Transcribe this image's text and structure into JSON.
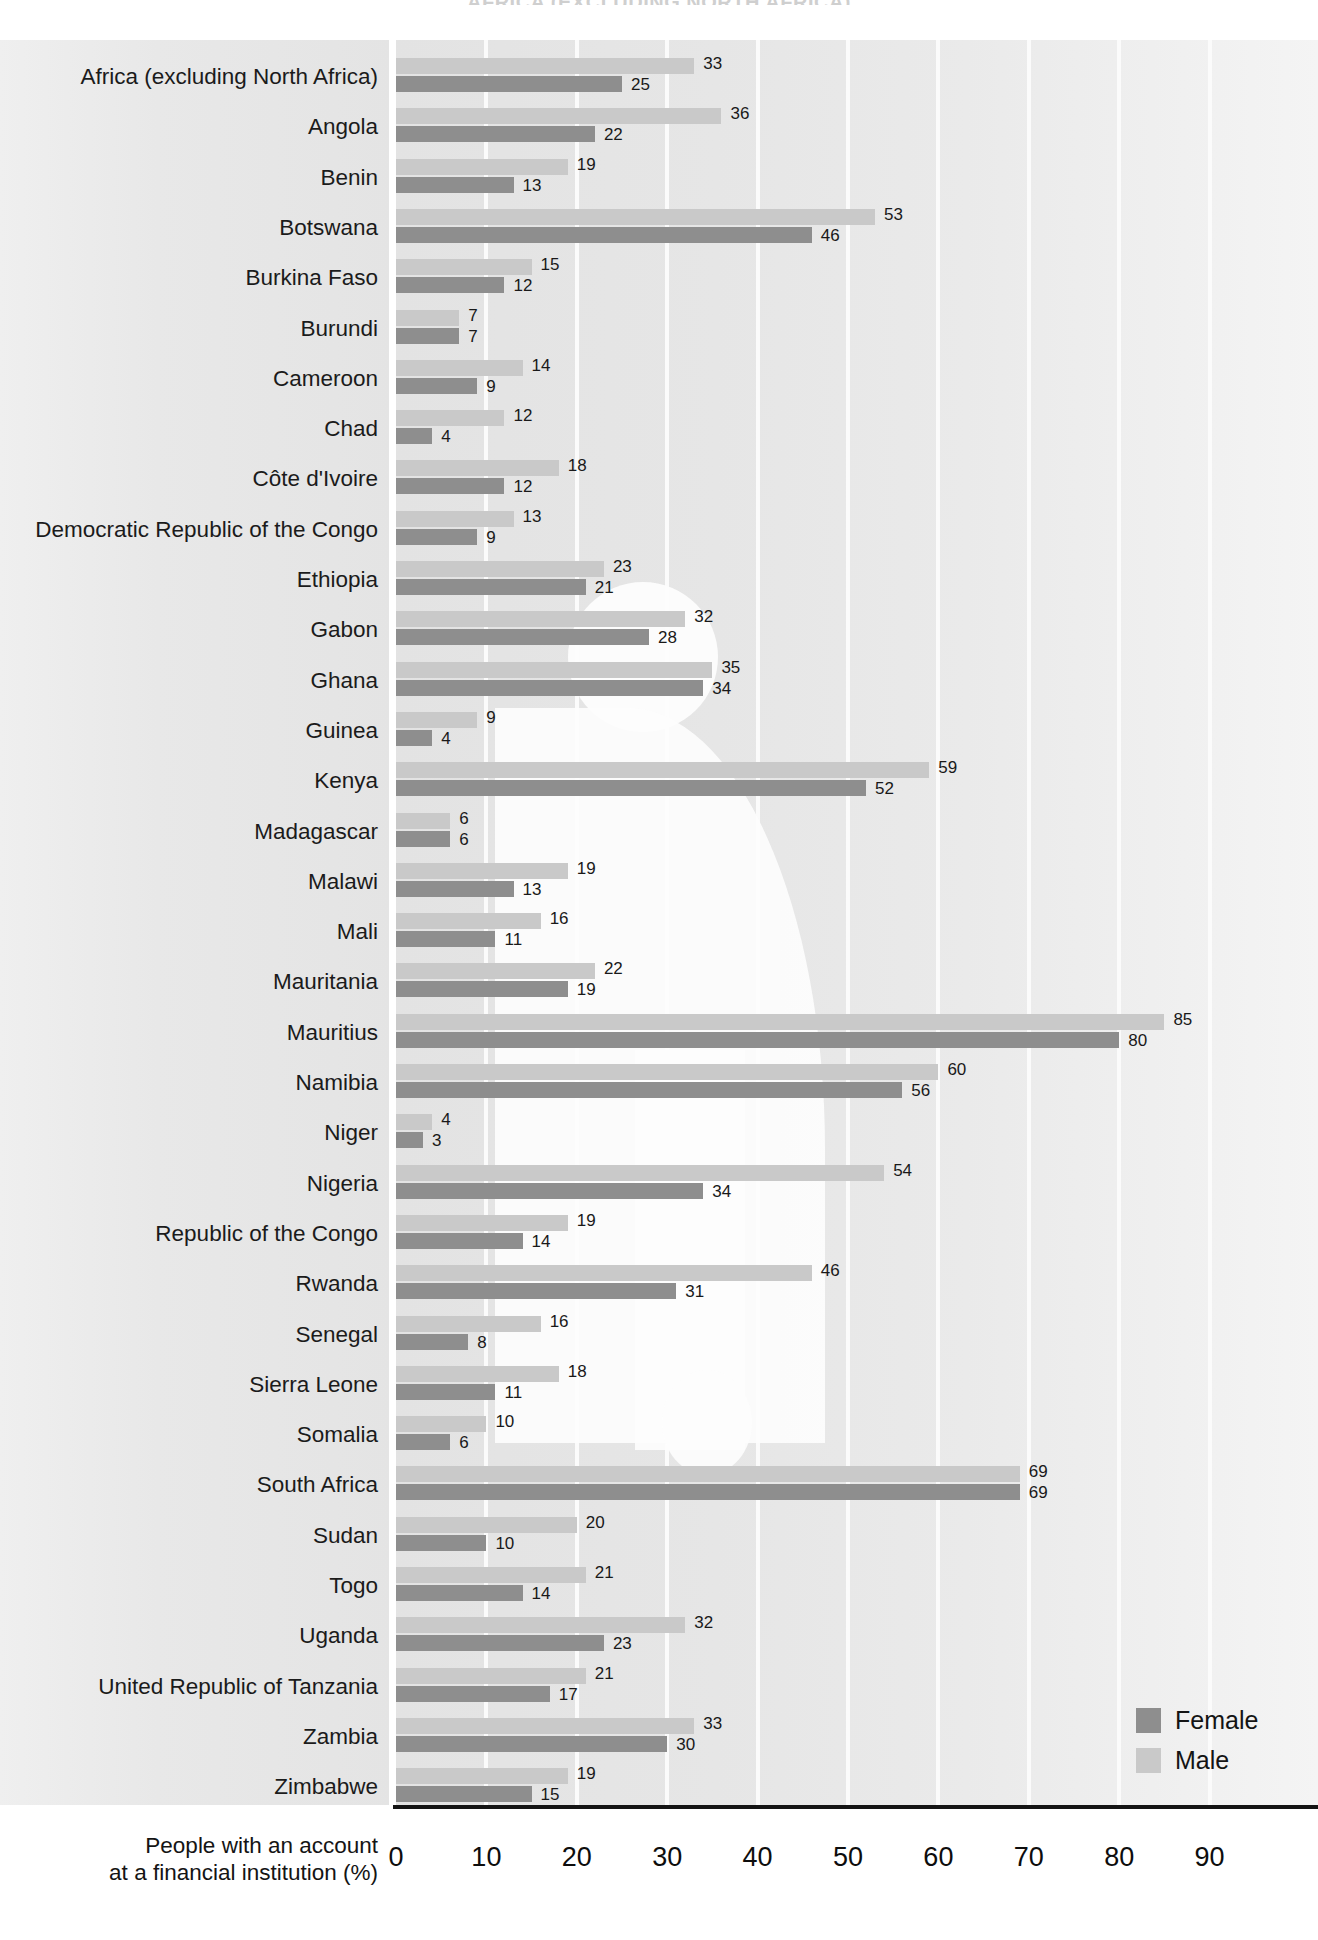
{
  "top_title": "AFRICA (EXCLUDING NORTH AFRICA)",
  "legend": {
    "items": [
      {
        "label": "Female",
        "color": "#8e8e8e"
      },
      {
        "label": "Male",
        "color": "#c9c9c9"
      }
    ]
  },
  "axis": {
    "title_line1": "People with an account",
    "title_line2": "at a financial institution (%)",
    "ticks": [
      "0",
      "10",
      "20",
      "30",
      "40",
      "50",
      "60",
      "70",
      "80",
      "90"
    ]
  },
  "chart_data": {
    "type": "bar",
    "orientation": "horizontal",
    "title": "AFRICA (EXCLUDING NORTH AFRICA)",
    "xlabel": "People with an account at a financial institution (%)",
    "ylabel": "",
    "xlim": [
      0,
      90
    ],
    "xticks": [
      0,
      10,
      20,
      30,
      40,
      50,
      60,
      70,
      80,
      90
    ],
    "grid": "vertical",
    "legend_position": "bottom-right",
    "categories": [
      "Africa (excluding North Africa)",
      "Angola",
      "Benin",
      "Botswana",
      "Burkina Faso",
      "Burundi",
      "Cameroon",
      "Chad",
      "Côte d'Ivoire",
      "Democratic Republic of the Congo",
      "Ethiopia",
      "Gabon",
      "Ghana",
      "Guinea",
      "Kenya",
      "Madagascar",
      "Malawi",
      "Mali",
      "Mauritania",
      "Mauritius",
      "Namibia",
      "Niger",
      "Nigeria",
      "Republic of the Congo",
      "Rwanda",
      "Senegal",
      "Sierra Leone",
      "Somalia",
      "South Africa",
      "Sudan",
      "Togo",
      "Uganda",
      "United Republic of Tanzania",
      "Zambia",
      "Zimbabwe"
    ],
    "series": [
      {
        "name": "Male",
        "color": "#c9c9c9",
        "values": [
          33,
          36,
          19,
          53,
          15,
          7,
          14,
          12,
          18,
          13,
          23,
          32,
          35,
          9,
          59,
          6,
          19,
          16,
          22,
          85,
          60,
          4,
          54,
          19,
          46,
          16,
          18,
          10,
          69,
          20,
          21,
          32,
          21,
          33,
          19
        ]
      },
      {
        "name": "Female",
        "color": "#8e8e8e",
        "values": [
          25,
          22,
          13,
          46,
          12,
          7,
          9,
          4,
          12,
          9,
          21,
          28,
          34,
          4,
          52,
          6,
          13,
          11,
          19,
          80,
          56,
          3,
          34,
          14,
          31,
          8,
          11,
          6,
          69,
          10,
          14,
          23,
          17,
          30,
          15
        ]
      }
    ]
  }
}
